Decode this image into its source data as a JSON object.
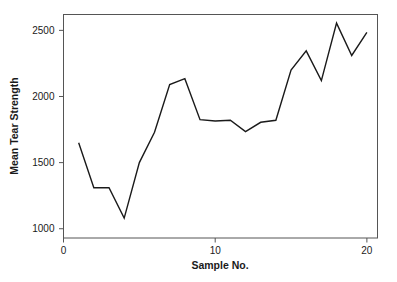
{
  "chart_data": {
    "type": "line",
    "title": "",
    "xlabel": "Sample No.",
    "ylabel": "Mean Tear Strength",
    "x": [
      1,
      2,
      3,
      4,
      5,
      6,
      7,
      8,
      9,
      10,
      11,
      12,
      13,
      14,
      15,
      16,
      17,
      18,
      19,
      20
    ],
    "values": [
      1650,
      1310,
      1310,
      1080,
      1500,
      1730,
      2090,
      2135,
      1825,
      1815,
      1820,
      1735,
      1805,
      1820,
      2200,
      2345,
      2120,
      2555,
      2310,
      2485
    ],
    "series": [
      {
        "name": "Mean Tear Strength",
        "values": [
          1650,
          1310,
          1310,
          1080,
          1500,
          1730,
          2090,
          2135,
          1825,
          1815,
          1820,
          1735,
          1805,
          1820,
          2200,
          2345,
          2120,
          2555,
          2310,
          2485
        ]
      }
    ],
    "xlim": [
      0,
      20.7
    ],
    "ylim": [
      930,
      2620
    ],
    "xticks": [
      0,
      10,
      20
    ],
    "xtick_labels": [
      "0",
      "10",
      "20"
    ],
    "yticks": [
      1000,
      1500,
      2000,
      2500
    ],
    "ytick_labels": [
      "1000",
      "1500",
      "2000",
      "2500"
    ],
    "grid": false,
    "legend": false,
    "line_color": "#1a1a1a",
    "frame_color": "#555555",
    "background": "#ffffff"
  }
}
